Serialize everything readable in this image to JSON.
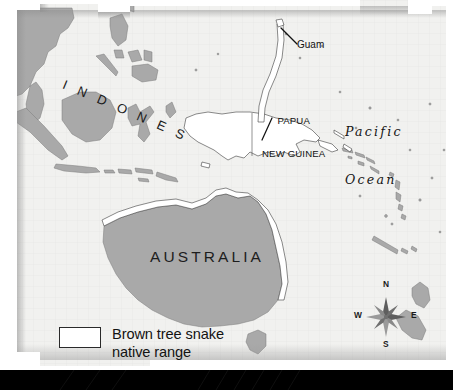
{
  "figure": {
    "kind": "map",
    "subject": "Brown tree snake native range",
    "region": "Southeast Asia, New Guinea, Australia and the western Pacific"
  },
  "colors": {
    "ocean": "#f1f1ef",
    "land": "#a9a9a9",
    "land_outline": "#6f6f6f",
    "range_fill": "#ffffff",
    "range_outline": "#3a3a3a",
    "text": "#1a1a1a",
    "paper": "#ffffff",
    "bottom_bar": "#000000",
    "graticule": "#e2e2df"
  },
  "labels": {
    "indonesia": "I N D O N E S I A",
    "australia": "AUSTRALIA",
    "papua_new_guinea_line1": "PAPUA",
    "papua_new_guinea_line2": "NEW GUINEA",
    "guam": "Guam",
    "pacific_line1": "Pacific",
    "pacific_line2": "Ocean"
  },
  "compass": {
    "north": "N",
    "east": "E",
    "south": "S",
    "west": "W"
  },
  "legend": {
    "swatch_fill": "#ffffff",
    "line1": "Brown tree snake",
    "line2": "native range"
  }
}
